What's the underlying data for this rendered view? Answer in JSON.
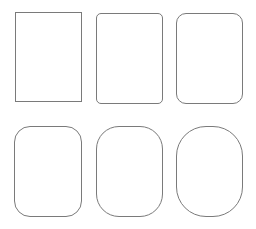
{
  "diagram": {
    "stroke_color": "#7a7a7a",
    "fill_color": "#ffffff",
    "shapes": [
      {
        "id": "rect-1",
        "x": 15,
        "y": 12,
        "width": 67,
        "height": 90,
        "radius": 0
      },
      {
        "id": "rect-2",
        "x": 96,
        "y": 13,
        "width": 67,
        "height": 91,
        "radius": 5
      },
      {
        "id": "rect-3",
        "x": 176,
        "y": 13,
        "width": 67,
        "height": 91,
        "radius": 10
      },
      {
        "id": "rect-4",
        "x": 14,
        "y": 126,
        "width": 68,
        "height": 91,
        "radius": 16
      },
      {
        "id": "rect-5",
        "x": 96,
        "y": 126,
        "width": 67,
        "height": 91,
        "radius": 23
      },
      {
        "id": "rect-6",
        "x": 176,
        "y": 126,
        "width": 67,
        "height": 91,
        "radius": 30
      }
    ]
  }
}
